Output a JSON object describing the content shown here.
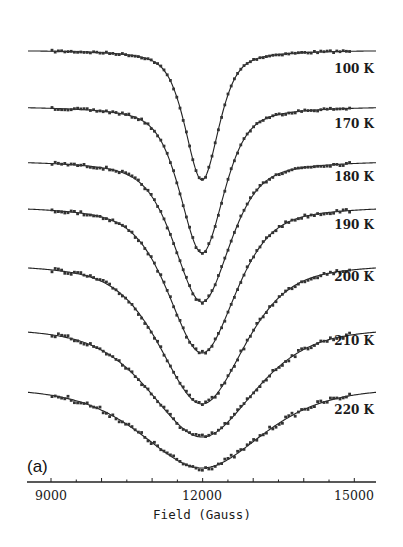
{
  "chart_data": {
    "type": "line",
    "title": "",
    "panel_label": "(a)",
    "xlabel": "Field (Gauss)",
    "ylabel": "",
    "xlim": [
      8530,
      15450
    ],
    "xticks": [
      9000,
      12000,
      15000
    ],
    "grid": false,
    "legend": "inline labels at right end of each trace",
    "series": [
      {
        "name": "100 K",
        "center_gauss": 12000,
        "fwhm_gauss": 900,
        "relative_depth": 1.0,
        "offset_index": 0
      },
      {
        "name": "170 K",
        "center_gauss": 11950,
        "fwhm_gauss": 1100,
        "relative_depth": 1.12,
        "offset_index": 1
      },
      {
        "name": "180 K",
        "center_gauss": 12000,
        "fwhm_gauss": 1400,
        "relative_depth": 1.08,
        "offset_index": 2
      },
      {
        "name": "190 K",
        "center_gauss": 12000,
        "fwhm_gauss": 1700,
        "relative_depth": 1.13,
        "offset_index": 3
      },
      {
        "name": "200 K",
        "center_gauss": 12000,
        "fwhm_gauss": 2100,
        "relative_depth": 1.08,
        "offset_index": 4
      },
      {
        "name": "210 K",
        "center_gauss": 12000,
        "fwhm_gauss": 2600,
        "relative_depth": 0.85,
        "offset_index": 5
      },
      {
        "name": "220 K",
        "center_gauss": 12000,
        "fwhm_gauss": 3000,
        "relative_depth": 0.63,
        "offset_index": 6
      }
    ]
  },
  "render": {
    "axis_y": 482,
    "px_per_gauss": 0.05055,
    "x_at_9000": 51,
    "traces": [
      {
        "label": "100 K",
        "base": 50,
        "depth": 130,
        "hw": 20,
        "label_y": 73,
        "x_start": 28
      },
      {
        "label": "170 K",
        "base": 106,
        "depth": 147,
        "hw": 26,
        "label_y": 128,
        "x_start": 28
      },
      {
        "label": "180 K",
        "base": 160,
        "depth": 142,
        "hw": 33,
        "label_y": 181,
        "x_start": 28
      },
      {
        "label": "190 K",
        "base": 205,
        "depth": 148,
        "hw": 40,
        "label_y": 229,
        "x_start": 28
      },
      {
        "label": "200 K",
        "base": 262,
        "depth": 142,
        "hw": 50,
        "label_y": 281,
        "x_start": 28
      },
      {
        "label": "210 K",
        "base": 325,
        "depth": 112,
        "hw": 62,
        "label_y": 345,
        "x_start": 28
      },
      {
        "label": "220 K",
        "base": 385,
        "depth": 83,
        "hw": 72,
        "label_y": 414,
        "x_start": 28
      }
    ]
  }
}
